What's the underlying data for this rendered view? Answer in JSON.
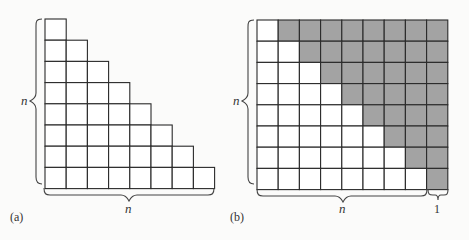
{
  "colors": {
    "shaded": "#a3a3a3",
    "unshaded": "#ffffff",
    "line": "#2a2a2a",
    "background": "#fbfbfa"
  },
  "panel_a": {
    "caption": "(a)",
    "description": "Staircase of unit squares: row k has k squares, k = 1..n (n = 8)",
    "n": 8,
    "row_lengths": [
      1,
      2,
      3,
      4,
      5,
      6,
      7,
      8
    ],
    "vertical_brace_label": "n",
    "horizontal_brace_label": "n"
  },
  "panel_b": {
    "caption": "(b)",
    "description": "n × (n+1) rectangle split into two congruent staircases; white lower-left staircase and gray upper-right staircase",
    "rows": 8,
    "cols": 9,
    "white_counts_per_row": [
      1,
      2,
      3,
      4,
      5,
      6,
      7,
      8
    ],
    "vertical_brace_label": "n",
    "horizontal_brace_label_main": "n",
    "horizontal_brace_label_extra": "1"
  }
}
